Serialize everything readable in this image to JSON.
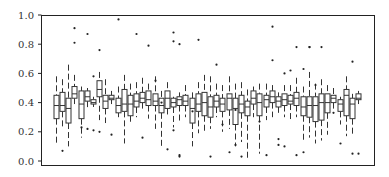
{
  "chart_data": {
    "type": "boxplot",
    "title": "",
    "xlabel": "",
    "ylabel": "",
    "ylim": [
      0.0,
      1.0
    ],
    "yticks": [
      "0.0",
      "0.2",
      "0.4",
      "0.6",
      "0.8",
      "1.0"
    ],
    "xticks": [],
    "grid": false,
    "legend": null,
    "series": [
      {
        "q1": 0.29,
        "med": 0.38,
        "q3": 0.45,
        "lo": 0.12,
        "hi": 0.58,
        "out": []
      },
      {
        "q1": 0.34,
        "med": 0.38,
        "q3": 0.47,
        "lo": 0.22,
        "hi": 0.56,
        "out": [
          0.07
        ]
      },
      {
        "q1": 0.26,
        "med": 0.36,
        "q3": 0.43,
        "lo": 0.1,
        "hi": 0.66,
        "out": []
      },
      {
        "q1": 0.43,
        "med": 0.46,
        "q3": 0.51,
        "lo": 0.39,
        "hi": 0.59,
        "out": [
          0.91,
          0.81
        ]
      },
      {
        "q1": 0.29,
        "med": 0.39,
        "q3": 0.48,
        "lo": 0.16,
        "hi": 0.51,
        "out": [
          0.23
        ]
      },
      {
        "q1": 0.41,
        "med": 0.44,
        "q3": 0.48,
        "lo": 0.35,
        "hi": 0.5,
        "out": [
          0.87,
          0.22
        ]
      },
      {
        "q1": 0.39,
        "med": 0.4,
        "q3": 0.42,
        "lo": 0.37,
        "hi": 0.44,
        "out": [
          0.58,
          0.21
        ]
      },
      {
        "q1": 0.44,
        "med": 0.49,
        "q3": 0.55,
        "lo": 0.28,
        "hi": 0.61,
        "out": [
          0.76,
          0.2
        ]
      },
      {
        "q1": 0.36,
        "med": 0.41,
        "q3": 0.45,
        "lo": 0.26,
        "hi": 0.56,
        "out": []
      },
      {
        "q1": 0.42,
        "med": 0.43,
        "q3": 0.45,
        "lo": 0.39,
        "hi": 0.48,
        "out": [
          0.18
        ]
      },
      {
        "q1": 0.33,
        "med": 0.38,
        "q3": 0.43,
        "lo": 0.3,
        "hi": 0.51,
        "out": [
          0.97
        ]
      },
      {
        "q1": 0.34,
        "med": 0.39,
        "q3": 0.49,
        "lo": 0.12,
        "hi": 0.59,
        "out": []
      },
      {
        "q1": 0.31,
        "med": 0.39,
        "q3": 0.45,
        "lo": 0.26,
        "hi": 0.53,
        "out": []
      },
      {
        "q1": 0.37,
        "med": 0.41,
        "q3": 0.46,
        "lo": 0.3,
        "hi": 0.54,
        "out": [
          0.87
        ]
      },
      {
        "q1": 0.4,
        "med": 0.43,
        "q3": 0.47,
        "lo": 0.35,
        "hi": 0.57,
        "out": [
          0.16
        ]
      },
      {
        "q1": 0.38,
        "med": 0.42,
        "q3": 0.48,
        "lo": 0.29,
        "hi": 0.53,
        "out": [
          0.79
        ]
      },
      {
        "q1": 0.38,
        "med": 0.41,
        "q3": 0.46,
        "lo": 0.22,
        "hi": 0.58,
        "out": [
          0.55
        ]
      },
      {
        "q1": 0.33,
        "med": 0.38,
        "q3": 0.43,
        "lo": 0.1,
        "hi": 0.48,
        "out": [
          0.4
        ]
      },
      {
        "q1": 0.36,
        "med": 0.43,
        "q3": 0.48,
        "lo": 0.3,
        "hi": 0.54,
        "out": [
          0.08
        ]
      },
      {
        "q1": 0.37,
        "med": 0.4,
        "q3": 0.43,
        "lo": 0.23,
        "hi": 0.44,
        "out": [
          0.88,
          0.82,
          0.21
        ]
      },
      {
        "q1": 0.38,
        "med": 0.42,
        "q3": 0.44,
        "lo": 0.27,
        "hi": 0.47,
        "out": [
          0.8,
          0.03,
          0.04
        ]
      },
      {
        "q1": 0.38,
        "med": 0.41,
        "q3": 0.45,
        "lo": 0.3,
        "hi": 0.52,
        "out": []
      },
      {
        "q1": 0.26,
        "med": 0.36,
        "q3": 0.43,
        "lo": 0.1,
        "hi": 0.47,
        "out": [
          0.34
        ]
      },
      {
        "q1": 0.34,
        "med": 0.39,
        "q3": 0.46,
        "lo": 0.19,
        "hi": 0.54,
        "out": [
          0.83
        ]
      },
      {
        "q1": 0.31,
        "med": 0.4,
        "q3": 0.47,
        "lo": 0.19,
        "hi": 0.59,
        "out": []
      },
      {
        "q1": 0.3,
        "med": 0.37,
        "q3": 0.44,
        "lo": 0.22,
        "hi": 0.58,
        "out": [
          0.03
        ]
      },
      {
        "q1": 0.37,
        "med": 0.41,
        "q3": 0.45,
        "lo": 0.3,
        "hi": 0.53,
        "out": [
          0.66
        ]
      },
      {
        "q1": 0.34,
        "med": 0.39,
        "q3": 0.43,
        "lo": 0.2,
        "hi": 0.52,
        "out": [
          0.25
        ]
      },
      {
        "q1": 0.35,
        "med": 0.43,
        "q3": 0.46,
        "lo": 0.22,
        "hi": 0.58,
        "out": [
          0.06
        ]
      },
      {
        "q1": 0.25,
        "med": 0.36,
        "q3": 0.43,
        "lo": 0.1,
        "hi": 0.53,
        "out": [
          0.11,
          0.35
        ]
      },
      {
        "q1": 0.33,
        "med": 0.39,
        "q3": 0.45,
        "lo": 0.13,
        "hi": 0.54,
        "out": [
          0.03
        ]
      },
      {
        "q1": 0.31,
        "med": 0.37,
        "q3": 0.41,
        "lo": 0.02,
        "hi": 0.49,
        "out": []
      },
      {
        "q1": 0.39,
        "med": 0.43,
        "q3": 0.48,
        "lo": 0.3,
        "hi": 0.51,
        "out": []
      },
      {
        "q1": 0.31,
        "med": 0.4,
        "q3": 0.46,
        "lo": 0.05,
        "hi": 0.53,
        "out": [
          0.27
        ]
      },
      {
        "q1": 0.37,
        "med": 0.42,
        "q3": 0.45,
        "lo": 0.28,
        "hi": 0.53,
        "out": [
          0.04
        ]
      },
      {
        "q1": 0.4,
        "med": 0.44,
        "q3": 0.48,
        "lo": 0.3,
        "hi": 0.52,
        "out": [
          0.92,
          0.69
        ]
      },
      {
        "q1": 0.37,
        "med": 0.41,
        "q3": 0.44,
        "lo": 0.33,
        "hi": 0.47,
        "out": [
          0.15,
          0.11
        ]
      },
      {
        "q1": 0.38,
        "med": 0.42,
        "q3": 0.46,
        "lo": 0.3,
        "hi": 0.52,
        "out": [
          0.6,
          0.1
        ]
      },
      {
        "q1": 0.39,
        "med": 0.41,
        "q3": 0.45,
        "lo": 0.28,
        "hi": 0.52,
        "out": [
          0.62
        ]
      },
      {
        "q1": 0.38,
        "med": 0.43,
        "q3": 0.47,
        "lo": 0.3,
        "hi": 0.57,
        "out": [
          0.78,
          0.04
        ]
      },
      {
        "q1": 0.31,
        "med": 0.37,
        "q3": 0.44,
        "lo": 0.13,
        "hi": 0.51,
        "out": [
          0.63,
          0.06
        ]
      },
      {
        "q1": 0.3,
        "med": 0.38,
        "q3": 0.44,
        "lo": 0.16,
        "hi": 0.61,
        "out": [
          0.78,
          0.78
        ]
      },
      {
        "q1": 0.27,
        "med": 0.38,
        "q3": 0.44,
        "lo": 0.12,
        "hi": 0.53,
        "out": [
          0.52
        ]
      },
      {
        "q1": 0.28,
        "med": 0.4,
        "q3": 0.46,
        "lo": 0.14,
        "hi": 0.56,
        "out": [
          0.78
        ]
      },
      {
        "q1": 0.33,
        "med": 0.4,
        "q3": 0.46,
        "lo": 0.18,
        "hi": 0.52,
        "out": []
      },
      {
        "q1": 0.4,
        "med": 0.43,
        "q3": 0.45,
        "lo": 0.35,
        "hi": 0.5,
        "out": [
          0.33
        ]
      },
      {
        "q1": 0.34,
        "med": 0.39,
        "q3": 0.42,
        "lo": 0.25,
        "hi": 0.44,
        "out": [
          0.12
        ]
      },
      {
        "q1": 0.31,
        "med": 0.45,
        "q3": 0.49,
        "lo": 0.17,
        "hi": 0.58,
        "out": []
      },
      {
        "q1": 0.29,
        "med": 0.39,
        "q3": 0.43,
        "lo": 0.18,
        "hi": 0.46,
        "out": [
          0.68,
          0.05
        ]
      },
      {
        "q1": 0.42,
        "med": 0.43,
        "q3": 0.46,
        "lo": 0.39,
        "hi": 0.48,
        "out": [
          0.05
        ]
      }
    ]
  }
}
